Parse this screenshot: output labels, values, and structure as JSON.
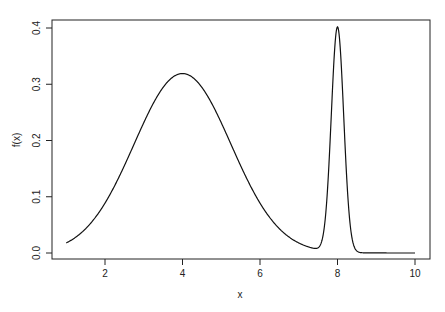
{
  "chart_data": {
    "type": "line",
    "title": "",
    "xlabel": "x",
    "ylabel": "f(x)",
    "xlim": [
      1,
      10
    ],
    "ylim": [
      0,
      0.4
    ],
    "x_ticks": [
      "2",
      "4",
      "6",
      "8",
      "10"
    ],
    "y_ticks": [
      "0.0",
      "0.1",
      "0.2",
      "0.3",
      "0.4"
    ],
    "grid": false,
    "legend": null,
    "series": [
      {
        "name": "f(x)",
        "components": [
          {
            "mean": 4,
            "sd": 1.25,
            "peak": 0.319
          },
          {
            "mean": 8,
            "sd": 0.16,
            "peak": 0.4
          }
        ],
        "sample_points": [
          {
            "x": 1,
            "y": 0.004
          },
          {
            "x": 2,
            "y": 0.04
          },
          {
            "x": 3,
            "y": 0.2
          },
          {
            "x": 4,
            "y": 0.319
          },
          {
            "x": 5,
            "y": 0.2
          },
          {
            "x": 6,
            "y": 0.04
          },
          {
            "x": 7,
            "y": 0.004
          },
          {
            "x": 7.5,
            "y": 0.0
          },
          {
            "x": 8,
            "y": 0.4
          },
          {
            "x": 8.5,
            "y": 0.0
          },
          {
            "x": 10,
            "y": 0.0
          }
        ]
      }
    ]
  }
}
